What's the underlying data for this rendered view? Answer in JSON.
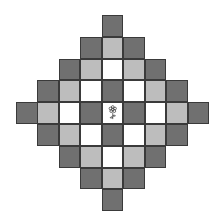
{
  "board": {
    "rows": 9,
    "cols": 9,
    "center": [
      4,
      4
    ],
    "colors": {
      "dark": "#707070",
      "light": "#bdbdbd",
      "white": "#ffffff",
      "border": "#3a3a3a"
    },
    "distance_to_shade": {
      "0": "white",
      "1": "dark",
      "2": "white",
      "3": "light",
      "4": "dark"
    },
    "center_icon": "flower-icon"
  }
}
